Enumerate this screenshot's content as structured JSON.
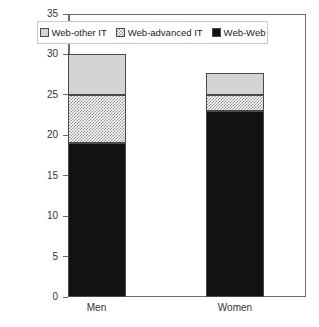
{
  "chart_data": {
    "type": "bar",
    "subtype": "stacked-vertical",
    "title": "",
    "xlabel": "",
    "ylabel": "",
    "categories": [
      "Men",
      "Women"
    ],
    "series": [
      {
        "name": "Web-Web",
        "values": [
          19,
          23
        ],
        "fill": "black-dotted",
        "color": "#121212"
      },
      {
        "name": "Web-advanced IT",
        "values": [
          6,
          2
        ],
        "fill": "gray-checker",
        "color": "#8e8e8e"
      },
      {
        "name": "Web-other IT",
        "values": [
          5,
          2.7
        ],
        "fill": "light-gray",
        "color": "#d4d4d4"
      }
    ],
    "totals": [
      30,
      27.7
    ],
    "ylim": [
      0,
      35
    ],
    "ytick_labels": [
      "0",
      "5",
      "10",
      "15",
      "20",
      "25",
      "30",
      "35"
    ],
    "ytick_values": [
      0,
      5,
      10,
      15,
      20,
      25,
      30,
      35
    ],
    "grid": true,
    "grid_axis": "y",
    "legend_position": "top-inside",
    "stack_order_bottom_to_top": [
      "Web-Web",
      "Web-advanced IT",
      "Web-other IT"
    ],
    "legend_order_left_to_right": [
      "Web-other IT",
      "Web-advanced IT",
      "Web-Web"
    ]
  },
  "legend": {
    "items": [
      {
        "label": "Web-other IT",
        "swatch": "light-gray-swatch-icon"
      },
      {
        "label": "Web-advanced IT",
        "swatch": "gray-checker-swatch-icon"
      },
      {
        "label": "Web-Web",
        "swatch": "black-dotted-swatch-icon"
      }
    ]
  },
  "axes": {
    "y": {
      "ticks": [
        "0",
        "5",
        "10",
        "15",
        "20",
        "25",
        "30",
        "35"
      ]
    },
    "x": {
      "ticks": [
        "Men",
        "Women"
      ]
    }
  }
}
